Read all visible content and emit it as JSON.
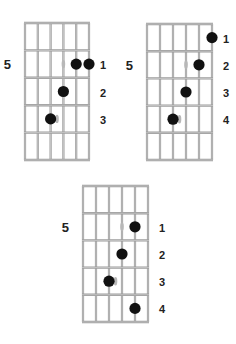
{
  "colors": {
    "grid": "#9a9a9a",
    "grid_fill": "#ffffff",
    "dot": "#111111",
    "ghost": "#b8b8b8",
    "text": "#222222"
  },
  "diagrams": [
    {
      "position_label": "5",
      "position_row": 2,
      "strings": 6,
      "frets": 5,
      "origin": {
        "x": 25,
        "y": 23
      },
      "string_spacing": 12.8,
      "fret_spacing": 27.4,
      "dots": [
        {
          "row": 2,
          "string": 5
        },
        {
          "row": 2,
          "string": 6
        },
        {
          "row": 3,
          "string": 4
        },
        {
          "row": 4,
          "string": 3
        }
      ],
      "ghosts": [
        {
          "row": 2,
          "string": 4
        },
        {
          "row": 4,
          "string": 3.5
        }
      ],
      "finger_labels": [
        {
          "row": 2,
          "text": "1"
        },
        {
          "row": 3,
          "text": "2"
        },
        {
          "row": 4,
          "text": "3"
        }
      ]
    },
    {
      "position_label": "5",
      "position_row": 2,
      "strings": 6,
      "frets": 5,
      "origin": {
        "x": 147,
        "y": 24
      },
      "string_spacing": 13,
      "fret_spacing": 27.2,
      "dots": [
        {
          "row": 1,
          "string": 6
        },
        {
          "row": 2,
          "string": 5
        },
        {
          "row": 3,
          "string": 4
        },
        {
          "row": 4,
          "string": 3
        }
      ],
      "ghosts": [
        {
          "row": 2,
          "string": 4
        },
        {
          "row": 4,
          "string": 3.5
        }
      ],
      "finger_labels": [
        {
          "row": 1,
          "text": "1"
        },
        {
          "row": 2,
          "text": "2"
        },
        {
          "row": 3,
          "text": "3"
        },
        {
          "row": 4,
          "text": "4"
        }
      ]
    },
    {
      "position_label": "5",
      "position_row": 2,
      "strings": 6,
      "frets": 5,
      "origin": {
        "x": 83,
        "y": 186
      },
      "string_spacing": 13,
      "fret_spacing": 27.2,
      "dots": [
        {
          "row": 2,
          "string": 5
        },
        {
          "row": 3,
          "string": 4
        },
        {
          "row": 4,
          "string": 3
        },
        {
          "row": 5,
          "string": 5
        }
      ],
      "ghosts": [
        {
          "row": 2,
          "string": 4
        },
        {
          "row": 4,
          "string": 3.5
        }
      ],
      "finger_labels": [
        {
          "row": 2,
          "text": "1"
        },
        {
          "row": 3,
          "text": "2"
        },
        {
          "row": 4,
          "text": "3"
        },
        {
          "row": 5,
          "text": "4"
        }
      ]
    }
  ]
}
